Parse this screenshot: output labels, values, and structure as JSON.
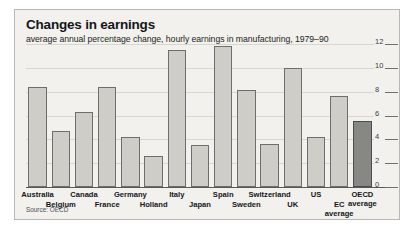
{
  "chart_data": {
    "type": "bar",
    "title": "Changes in earnings",
    "subtitle": "average annual percentage change, hourly earnings in manufacturing, 1979–90",
    "source": "Source: OECD",
    "xlabel": "",
    "ylabel": "",
    "ylim": [
      0,
      12
    ],
    "yticks": [
      0,
      2,
      4,
      6,
      8,
      10,
      12
    ],
    "ytick_labels": [
      "0",
      "2",
      "4",
      "6",
      "8",
      "10",
      "12"
    ],
    "yaxis_position": "right",
    "grid": true,
    "legend": "none",
    "categories": [
      "Australia",
      "Belgium",
      "Canada",
      "France",
      "Germany",
      "Holland",
      "Italy",
      "Japan",
      "Spain",
      "Sweden",
      "Switzerland",
      "UK",
      "US",
      "EC average",
      "OECD average"
    ],
    "values": [
      8.4,
      4.7,
      6.3,
      8.4,
      4.2,
      2.6,
      11.5,
      3.5,
      11.8,
      8.1,
      3.6,
      10.0,
      4.2,
      7.6,
      5.5
    ],
    "bar_colors": [
      "#cfcdc7",
      "#cfcdc7",
      "#cfcdc7",
      "#cfcdc7",
      "#cfcdc7",
      "#cfcdc7",
      "#cfcdc7",
      "#cfcdc7",
      "#cfcdc7",
      "#cfcdc7",
      "#cfcdc7",
      "#cfcdc7",
      "#cfcdc7",
      "#cfcdc7",
      "#878783"
    ],
    "highlighted_category": "OECD average",
    "label_rows": [
      0,
      1,
      0,
      1,
      0,
      1,
      0,
      1,
      0,
      1,
      0,
      1,
      0,
      1,
      0
    ],
    "label_text": [
      "Australia",
      "Belgium",
      "Canada",
      "France",
      "Germany",
      "Holland",
      "Italy",
      "Japan",
      "Spain",
      "Sweden",
      "Switzerland",
      "UK",
      "US",
      "EC\naverage",
      "OECD\naverage"
    ]
  },
  "colors": {
    "panel_background": "#f2f1ee",
    "panel_border": "#b9b7b1",
    "bar_fill": "#cfcdc7",
    "bar_stroke": "#6d6d6b",
    "bar_fill_highlight": "#878783",
    "bar_stroke_highlight": "#4c4c4a",
    "gridline": "#d8d6d0",
    "baseline": "#58585a",
    "title_text": "#14161a",
    "body_text": "#1b1d20",
    "tick_text": "#3a3c40"
  }
}
